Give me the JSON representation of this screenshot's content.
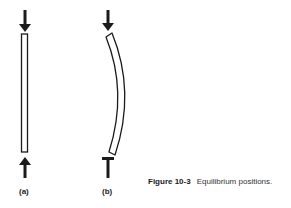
{
  "figure": {
    "number_label": "Figure 10-3",
    "caption": "Equilibrium positions.",
    "panels": [
      {
        "label": "(a)",
        "description": "straight column under axial compression"
      },
      {
        "label": "(b)",
        "description": "bent (buckled) column under axial compression"
      }
    ]
  },
  "colors": {
    "ink": "#1a1a1a",
    "background": "#ffffff"
  }
}
